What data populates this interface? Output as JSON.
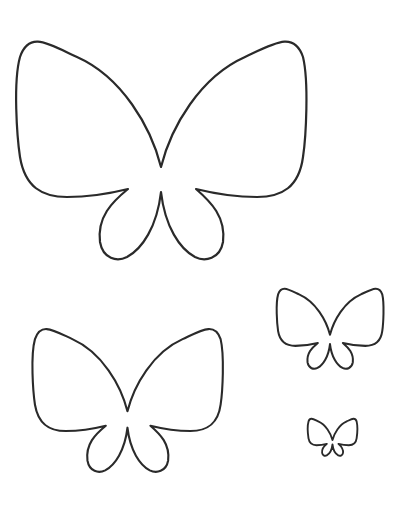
{
  "page": {
    "background": "#ffffff",
    "stroke_color": "#2a2a2a"
  },
  "butterflies": [
    {
      "name": "large",
      "x": 17,
      "y": 37,
      "scale": 1.0
    },
    {
      "name": "medium",
      "x": 33,
      "y": 326,
      "scale": 0.656
    },
    {
      "name": "small",
      "x": 277,
      "y": 287,
      "scale": 0.368
    },
    {
      "name": "tiny",
      "x": 308,
      "y": 418,
      "scale": 0.17
    }
  ]
}
